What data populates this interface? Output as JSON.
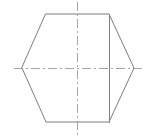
{
  "document": {
    "title": "Hexagon Orthographic View",
    "background_color": "#ffffff",
    "width": 149,
    "height": 140
  },
  "style": {
    "outline_color": "#7d7d7d",
    "interior_edge_color": "#828282",
    "center_line_color": "#a6a6a6",
    "face_fill_color": "#ffffff",
    "outline_width": 1,
    "center_line_width": 1,
    "center_line_dash_pattern": "9 3 2 3"
  },
  "drawing": {
    "name": "hexagonal-prism-view",
    "shapes": [
      {
        "name": "hexagon-outline",
        "type": "polygon",
        "points": "46,14 109,14 134,68 109,122 46,122 22,68"
      },
      {
        "name": "interior-vertical-edge",
        "type": "line",
        "x1": 109,
        "y1": 14,
        "x2": 109,
        "y2": 122
      }
    ],
    "center_lines": [
      {
        "name": "vertical-center-line",
        "type": "line",
        "x1": 77,
        "y1": 2,
        "x2": 77,
        "y2": 137
      },
      {
        "name": "horizontal-center-line",
        "type": "line",
        "x1": 14,
        "y1": 68,
        "x2": 145,
        "y2": 68
      }
    ],
    "vertices": [
      {
        "name": "vertex-top-left",
        "x": 46,
        "y": 14
      },
      {
        "name": "vertex-top-right",
        "x": 109,
        "y": 14
      },
      {
        "name": "vertex-right",
        "x": 134,
        "y": 68
      },
      {
        "name": "vertex-bottom-right",
        "x": 109,
        "y": 122
      },
      {
        "name": "vertex-bottom-left",
        "x": 46,
        "y": 122
      },
      {
        "name": "vertex-left",
        "x": 22,
        "y": 68
      }
    ]
  }
}
